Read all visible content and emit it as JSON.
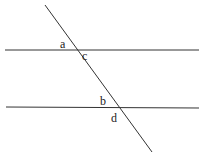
{
  "diagram": {
    "type": "parallel-lines-transversal",
    "lines": {
      "top": {
        "x1": 5,
        "y1": 50,
        "x2": 199,
        "y2": 50
      },
      "bottom": {
        "x1": 6,
        "y1": 107,
        "x2": 199,
        "y2": 108
      },
      "transversal": {
        "x1": 45,
        "y1": 5,
        "x2": 152,
        "y2": 152
      }
    },
    "labels": {
      "a": "a",
      "b": "b",
      "c": "c",
      "d": "d"
    },
    "stroke_color": "#333333"
  }
}
